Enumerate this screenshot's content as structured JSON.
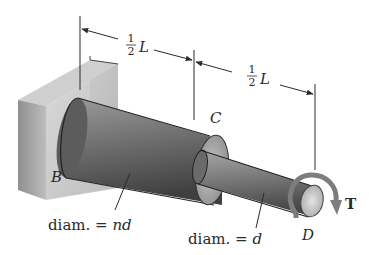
{
  "figure": {
    "labels": {
      "dim_left_num": "1",
      "dim_left_den": "2",
      "dim_left_var": "L",
      "dim_right_num": "1",
      "dim_right_den": "2",
      "dim_right_var": "L",
      "point_b": "B",
      "point_c": "C",
      "point_d": "D",
      "torque": "T",
      "diam_large_prefix": "diam. = ",
      "diam_large_value": "nd",
      "diam_small_prefix": "diam. = ",
      "diam_small_value": "d"
    },
    "colors": {
      "wall": "#b9b9b9",
      "shaft_large": "#6e6e6e",
      "shaft_small": "#7a7a7a",
      "torque_arrow": "#7d7d7d",
      "ink": "#2a2a2a"
    }
  }
}
